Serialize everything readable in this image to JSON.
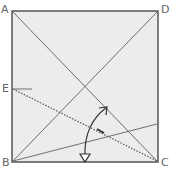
{
  "diagram": {
    "labels": {
      "A": "A",
      "B": "B",
      "C": "C",
      "D": "D",
      "E": "E"
    },
    "colors": {
      "paper": "#ececec",
      "border": "#555555",
      "line": "#6e6e6e",
      "dotted": "#555555",
      "arrow": "#333333"
    },
    "elements": [
      "square paper ABCD",
      "diagonal A to C",
      "diagonal B to D",
      "crease from B to right edge",
      "valley fold line (dotted) from E to C",
      "fold arrow (curved, two-headed)",
      "short mark at E"
    ]
  }
}
